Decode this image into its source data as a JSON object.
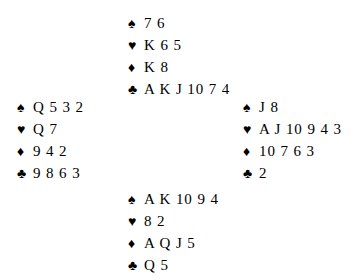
{
  "diagram": {
    "type": "bridge-deal-diagram",
    "background_color": "#ffffff",
    "text_color": "#000000",
    "suit_symbols": {
      "spades": "♠",
      "hearts": "♥",
      "diamonds": "♦",
      "clubs": "♣"
    },
    "hands": {
      "north": {
        "spades": "7 6",
        "hearts": "K 6 5",
        "diamonds": "K 8",
        "clubs": "A K J 10 7 4"
      },
      "west": {
        "spades": "Q 5 3 2",
        "hearts": "Q 7",
        "diamonds": "9 4 2",
        "clubs": "9 8 6 3"
      },
      "east": {
        "spades": "J 8",
        "hearts": "A J 10 9 4 3",
        "diamonds": "10 7 6 3",
        "clubs": "2"
      },
      "south": {
        "spades": "A K 10 9 4",
        "hearts": "8 2",
        "diamonds": "A Q J 5",
        "clubs": "Q 5"
      }
    }
  }
}
